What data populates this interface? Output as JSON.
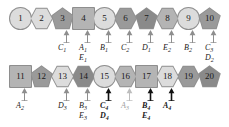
{
  "diagram": {
    "rows": [
      {
        "name": "top-row",
        "nodes": [
          {
            "id": "1",
            "label": "1",
            "shape": "circle",
            "tone": "light",
            "x": 10,
            "y": 8
          },
          {
            "id": "2",
            "label": "2",
            "shape": "hexagon",
            "tone": "light",
            "x": 31,
            "y": 8
          },
          {
            "id": "3",
            "label": "3",
            "shape": "pentagon",
            "tone": "dark",
            "x": 52,
            "y": 8
          },
          {
            "id": "4",
            "label": "4",
            "shape": "square",
            "tone": "mid",
            "x": 73,
            "y": 8
          },
          {
            "id": "5",
            "label": "5",
            "shape": "circle",
            "tone": "light",
            "x": 94,
            "y": 8
          },
          {
            "id": "6",
            "label": "6",
            "shape": "hexagon",
            "tone": "dark",
            "x": 115,
            "y": 8
          },
          {
            "id": "7",
            "label": "7",
            "shape": "pentagon",
            "tone": "darker",
            "x": 136,
            "y": 8
          },
          {
            "id": "8",
            "label": "8",
            "shape": "hexagon",
            "tone": "mid",
            "x": 157,
            "y": 8
          },
          {
            "id": "9",
            "label": "9",
            "shape": "circle",
            "tone": "light",
            "x": 178,
            "y": 8
          },
          {
            "id": "10",
            "label": "10",
            "shape": "pentagon",
            "tone": "dark",
            "x": 199,
            "y": 8
          }
        ],
        "arrows": [
          {
            "id": "arrow-c1",
            "x": 63,
            "y": 30,
            "weight": "normal"
          },
          {
            "id": "arrow-a1e1",
            "x": 84,
            "y": 30,
            "weight": "normal"
          },
          {
            "id": "arrow-b1",
            "x": 105,
            "y": 30,
            "weight": "normal"
          },
          {
            "id": "arrow-c2",
            "x": 126,
            "y": 30,
            "weight": "normal"
          },
          {
            "id": "arrow-d1",
            "x": 147,
            "y": 30,
            "weight": "normal"
          },
          {
            "id": "arrow-e2",
            "x": 168,
            "y": 30,
            "weight": "normal"
          },
          {
            "id": "arrow-b2",
            "x": 189,
            "y": 30,
            "weight": "normal"
          },
          {
            "id": "arrow-c3d2",
            "x": 210,
            "y": 30,
            "weight": "normal"
          }
        ],
        "labels": [
          {
            "id": "label-c1",
            "base": "C",
            "sub": "1",
            "x": 58,
            "y": 44,
            "style": "normal"
          },
          {
            "id": "label-a1",
            "base": "A",
            "sub": "1",
            "x": 79,
            "y": 44,
            "style": "normal"
          },
          {
            "id": "label-e1",
            "base": "E",
            "sub": "1",
            "x": 79,
            "y": 54,
            "style": "normal"
          },
          {
            "id": "label-b1",
            "base": "B",
            "sub": "1",
            "x": 100,
            "y": 44,
            "style": "normal"
          },
          {
            "id": "label-c2",
            "base": "C",
            "sub": "2",
            "x": 121,
            "y": 44,
            "style": "normal"
          },
          {
            "id": "label-d1",
            "base": "D",
            "sub": "1",
            "x": 142,
            "y": 44,
            "style": "normal"
          },
          {
            "id": "label-e2",
            "base": "E",
            "sub": "2",
            "x": 163,
            "y": 44,
            "style": "normal"
          },
          {
            "id": "label-b2",
            "base": "B",
            "sub": "2",
            "x": 184,
            "y": 44,
            "style": "normal"
          },
          {
            "id": "label-c3",
            "base": "C",
            "sub": "3",
            "x": 205,
            "y": 44,
            "style": "normal"
          },
          {
            "id": "label-d2",
            "base": "D",
            "sub": "2",
            "x": 205,
            "y": 54,
            "style": "normal"
          }
        ]
      },
      {
        "name": "bottom-row",
        "nodes": [
          {
            "id": "11",
            "label": "11",
            "shape": "square",
            "tone": "mid",
            "x": 10,
            "y": 66
          },
          {
            "id": "12",
            "label": "12",
            "shape": "pentagon",
            "tone": "dark",
            "x": 31,
            "y": 66
          },
          {
            "id": "13",
            "label": "13",
            "shape": "hexagon",
            "tone": "light",
            "x": 52,
            "y": 66
          },
          {
            "id": "14",
            "label": "14",
            "shape": "hexagon",
            "tone": "darker",
            "x": 73,
            "y": 66
          },
          {
            "id": "15",
            "label": "15",
            "shape": "circle",
            "tone": "light",
            "x": 94,
            "y": 66
          },
          {
            "id": "16",
            "label": "16",
            "shape": "hexagon",
            "tone": "mid",
            "x": 115,
            "y": 66
          },
          {
            "id": "17",
            "label": "17",
            "shape": "square",
            "tone": "mid",
            "x": 136,
            "y": 66
          },
          {
            "id": "18",
            "label": "18",
            "shape": "hexagon",
            "tone": "light",
            "x": 157,
            "y": 66
          },
          {
            "id": "19",
            "label": "19",
            "shape": "hexagon",
            "tone": "dark",
            "x": 178,
            "y": 66
          },
          {
            "id": "20",
            "label": "20",
            "shape": "pentagon",
            "tone": "darker",
            "x": 199,
            "y": 66
          }
        ],
        "arrows": [
          {
            "id": "arrow-a2",
            "x": 21,
            "y": 88,
            "weight": "normal"
          },
          {
            "id": "arrow-d3",
            "x": 63,
            "y": 88,
            "weight": "normal"
          },
          {
            "id": "arrow-b3e3",
            "x": 84,
            "y": 88,
            "weight": "normal"
          },
          {
            "id": "arrow-c4d4",
            "x": 105,
            "y": 88,
            "weight": "bold"
          },
          {
            "id": "arrow-a3",
            "x": 126,
            "y": 88,
            "weight": "faint"
          },
          {
            "id": "arrow-b4e4",
            "x": 147,
            "y": 88,
            "weight": "bold"
          },
          {
            "id": "arrow-a4",
            "x": 168,
            "y": 88,
            "weight": "bold"
          }
        ],
        "labels": [
          {
            "id": "label-a2",
            "base": "A",
            "sub": "2",
            "x": 16,
            "y": 102,
            "style": "normal"
          },
          {
            "id": "label-d3",
            "base": "D",
            "sub": "3",
            "x": 58,
            "y": 102,
            "style": "normal"
          },
          {
            "id": "label-b3",
            "base": "B",
            "sub": "3",
            "x": 79,
            "y": 102,
            "style": "normal"
          },
          {
            "id": "label-e3",
            "base": "E",
            "sub": "3",
            "x": 79,
            "y": 112,
            "style": "normal"
          },
          {
            "id": "label-c4",
            "base": "C",
            "sub": "4",
            "x": 100,
            "y": 102,
            "style": "bold"
          },
          {
            "id": "label-d4",
            "base": "D",
            "sub": "4",
            "x": 100,
            "y": 112,
            "style": "bold"
          },
          {
            "id": "label-a3",
            "base": "A",
            "sub": "3",
            "x": 121,
            "y": 102,
            "style": "faint"
          },
          {
            "id": "label-b4",
            "base": "B",
            "sub": "4",
            "x": 142,
            "y": 102,
            "style": "bold"
          },
          {
            "id": "label-e4",
            "base": "E",
            "sub": "4",
            "x": 142,
            "y": 112,
            "style": "bold"
          },
          {
            "id": "label-a4",
            "base": "A",
            "sub": "4",
            "x": 163,
            "y": 102,
            "style": "bold"
          }
        ]
      }
    ],
    "colors": {
      "background": "#ffffff",
      "tone_light": "#dcdcdc",
      "tone_mid": "#b4b4b4",
      "tone_dark": "#9a9a9a",
      "tone_darker": "#8a8a8a",
      "outline": "#8e8e8e",
      "text": "#1a1a1a",
      "faint_text": "#9d9d9d"
    }
  }
}
